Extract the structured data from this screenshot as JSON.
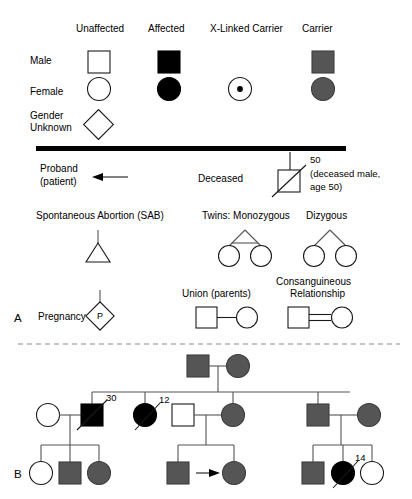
{
  "legend": {
    "column_headers": [
      "Unaffected",
      "Affected",
      "X-Linked Carrier",
      "Carrier"
    ],
    "row_labels": [
      "Male",
      "Female",
      "Gender",
      "Unknown"
    ],
    "row_label_male": "Male",
    "row_label_female": "Female",
    "row_label_unknown_line1": "Gender",
    "row_label_unknown_line2": "Unknown"
  },
  "symbols": {
    "proband_line1": "Proband",
    "proband_line2": "(patient)",
    "deceased_label": "Deceased",
    "deceased_age": "50",
    "deceased_note_line1": "(deceased male,",
    "deceased_note_line2": "age 50)",
    "sab_label": "Spontaneous Abortion (SAB)",
    "twins_mono_label": "Twins: Monozygous",
    "twins_di_label": "Dizygous",
    "pregnancy_label": "Pregnancy",
    "pregnancy_mark": "P",
    "union_label": "Union (parents)",
    "consanguineous_line1": "Consanguineous",
    "consanguineous_line2": "Relationship"
  },
  "panels": {
    "a_label": "A",
    "b_label": "B"
  },
  "pedigree": {
    "ages": {
      "gen2_left_male": "30",
      "gen2_affected_female": "12",
      "gen3_right_female": "14"
    },
    "generation_1": [
      {
        "id": "I-1",
        "shape": "square",
        "status": "carrier"
      },
      {
        "id": "I-2",
        "shape": "circle",
        "status": "carrier"
      }
    ],
    "generation_2": [
      {
        "id": "II-1",
        "shape": "circle",
        "status": "unaffected"
      },
      {
        "id": "II-2",
        "shape": "square",
        "status": "affected",
        "deceased": true,
        "age": "30"
      },
      {
        "id": "II-3",
        "shape": "circle",
        "status": "affected",
        "deceased": true,
        "age": "12"
      },
      {
        "id": "II-4",
        "shape": "square",
        "status": "unaffected"
      },
      {
        "id": "II-5",
        "shape": "circle",
        "status": "carrier"
      },
      {
        "id": "II-6",
        "shape": "square",
        "status": "carrier"
      },
      {
        "id": "II-7",
        "shape": "circle",
        "status": "carrier"
      }
    ],
    "generation_3": [
      {
        "id": "III-1",
        "shape": "circle",
        "status": "unaffected"
      },
      {
        "id": "III-2",
        "shape": "square",
        "status": "carrier"
      },
      {
        "id": "III-3",
        "shape": "circle",
        "status": "carrier"
      },
      {
        "id": "III-4",
        "shape": "square",
        "status": "carrier"
      },
      {
        "id": "III-5",
        "shape": "circle",
        "status": "carrier",
        "proband": true
      },
      {
        "id": "III-6",
        "shape": "square",
        "status": "carrier"
      },
      {
        "id": "III-7",
        "shape": "circle",
        "status": "affected",
        "deceased": true,
        "age": "14"
      },
      {
        "id": "III-8",
        "shape": "circle",
        "status": "unaffected"
      }
    ]
  },
  "colors": {
    "affected": "#000000",
    "carrier": "#555555",
    "unaffected": "#ffffff",
    "stroke": "#1a1a1a",
    "divider_dashed": "#8c8c8c"
  }
}
